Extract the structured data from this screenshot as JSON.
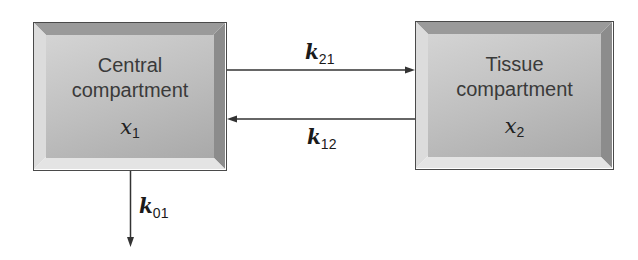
{
  "diagram": {
    "type": "two-compartment model",
    "compartments": [
      {
        "id": "central",
        "label_line1": "Central",
        "label_line2": "compartment",
        "var_symbol": "x",
        "var_sub": "1"
      },
      {
        "id": "tissue",
        "label_line1": "Tissue",
        "label_line2": "compartment",
        "var_symbol": "x",
        "var_sub": "2"
      }
    ],
    "rates": [
      {
        "id": "k21",
        "symbol": "k",
        "sub": "21",
        "from": "central",
        "to": "tissue"
      },
      {
        "id": "k12",
        "symbol": "k",
        "sub": "12",
        "from": "tissue",
        "to": "central"
      },
      {
        "id": "k01",
        "symbol": "k",
        "sub": "01",
        "from": "central",
        "to": "outside"
      }
    ],
    "colors": {
      "box_face": "#bdbdbd",
      "border": "#4a4a4a",
      "arrow": "#333333"
    }
  }
}
